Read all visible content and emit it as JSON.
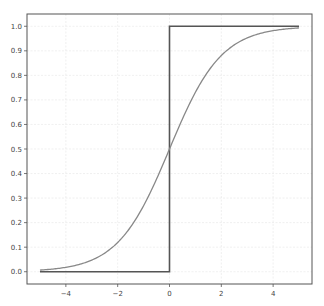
{
  "chart_data": {
    "type": "line",
    "title": "",
    "xlabel": "",
    "ylabel": "",
    "xlim": [
      -5.5,
      5.5
    ],
    "ylim": [
      -0.05,
      1.05
    ],
    "grid": true,
    "legend": null,
    "x_ticks": [
      -4,
      -2,
      0,
      2,
      4
    ],
    "x_tick_labels": [
      "−4",
      "−2",
      "0",
      "2",
      "4"
    ],
    "y_ticks": [
      0.0,
      0.1,
      0.2,
      0.3,
      0.4,
      0.5,
      0.6,
      0.7,
      0.8,
      0.9,
      1.0
    ],
    "y_tick_labels": [
      "0.0",
      "0.1",
      "0.2",
      "0.3",
      "0.4",
      "0.5",
      "0.6",
      "0.7",
      "0.8",
      "0.9",
      "1.0"
    ],
    "series": [
      {
        "name": "step",
        "color": "#555555",
        "x": [
          -5,
          -4,
          -3,
          -2,
          -1,
          0,
          0,
          1,
          2,
          3,
          4,
          5
        ],
        "y": [
          0,
          0,
          0,
          0,
          0,
          0,
          1,
          1,
          1,
          1,
          1,
          1
        ]
      },
      {
        "name": "sigmoid",
        "color": "#888888",
        "x": [
          -5,
          -4,
          -3,
          -2,
          -1,
          0,
          1,
          2,
          3,
          4,
          5
        ],
        "y": [
          0.0067,
          0.018,
          0.047,
          0.119,
          0.269,
          0.5,
          0.731,
          0.881,
          0.953,
          0.982,
          0.9933
        ]
      }
    ]
  }
}
